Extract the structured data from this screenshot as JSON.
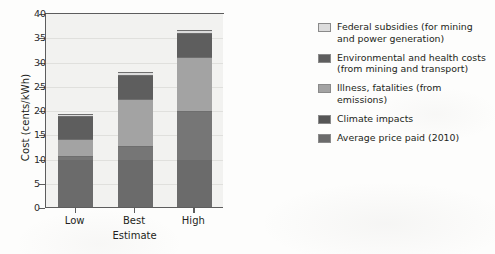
{
  "chart_data": {
    "type": "bar",
    "subtype": "stacked-bar",
    "title": "",
    "xlabel": "Estimate",
    "ylabel": "Cost (cents/kWh)",
    "categories": [
      "Low",
      "Best",
      "High"
    ],
    "ylim": [
      0,
      40
    ],
    "yticks": [
      0,
      5,
      10,
      15,
      20,
      25,
      30,
      35,
      40
    ],
    "ytick_labels": [
      "0",
      "5",
      "10",
      "15",
      "20",
      "25",
      "30",
      "35",
      "40"
    ],
    "grid": "horizontal",
    "legend_position": "right",
    "series": [
      {
        "name": "Average price paid (2010)",
        "color": "#6b6b6b",
        "values": [
          9.7,
          9.7,
          9.7
        ]
      },
      {
        "name": "Climate impacts",
        "color": "#767676",
        "values": [
          0.8,
          2.8,
          10.1
        ]
      },
      {
        "name": "Illness, fatalities (from emissions)",
        "color": "#a3a3a3",
        "values": [
          3.5,
          9.8,
          11.2
        ]
      },
      {
        "name": "Environmental and health costs (from mining and transport)",
        "color": "#5e5e5e",
        "values": [
          4.8,
          4.9,
          4.8
        ]
      },
      {
        "name": "Federal subsidies (for mining and power generation)",
        "color": "#dcdcdc",
        "values": [
          0.3,
          0.7,
          0.7
        ]
      }
    ],
    "totals": [
      19.1,
      27.9,
      36.5
    ]
  },
  "legend": {
    "items": [
      {
        "label": "Federal subsidies (for mining and power generation)",
        "swatch": "#dcdcdc"
      },
      {
        "label": "Environmental and health costs (from mining and transport)",
        "swatch": "#5e5e5e"
      },
      {
        "label": "Illness, fatalities (from emissions)",
        "swatch": "#a3a3a3"
      },
      {
        "label": "Climate impacts",
        "swatch": "#565656"
      },
      {
        "label": "Average price paid (2010)",
        "swatch": "#6b6b6b"
      }
    ]
  }
}
